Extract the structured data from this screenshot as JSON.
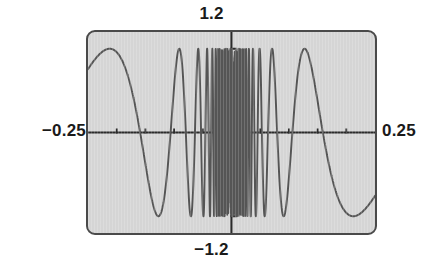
{
  "figure": {
    "kind": "graphing-calculator-screen",
    "labels": {
      "top": "1.2",
      "bottom": "−1.2",
      "left": "−0.25",
      "right": "0.25"
    },
    "colors": {
      "screen_background": "#d5d5d5",
      "frame": "#4a4a4a",
      "curve": "#555555",
      "axis": "#2b2b2b",
      "label_text": "#1a1a1a",
      "page_background": "#ffffff"
    }
  },
  "chart_data": {
    "type": "line",
    "title": "",
    "xlabel": "",
    "ylabel": "",
    "xlim": [
      -0.25,
      0.25
    ],
    "ylim": [
      -1.2,
      1.2
    ],
    "grid": false,
    "legend": null,
    "axes": {
      "x_axis_at_y": 0,
      "y_axis_at_x": 0,
      "x_ticks": [
        -0.2,
        -0.15,
        -0.1,
        -0.05,
        0.05,
        0.1,
        0.15,
        0.2
      ],
      "y_ticks": [
        -1.0,
        -0.8,
        -0.6,
        -0.4,
        -0.2,
        0.2,
        0.4,
        0.6,
        0.8,
        1.0
      ],
      "x_tick_labels": [
        "-0.25",
        "0.25"
      ],
      "y_tick_labels": [
        "-1.2",
        "1.2"
      ]
    },
    "series": [
      {
        "name": "y = sin(1/x)",
        "expression": "sin(1/x)",
        "amplitude": 1.0,
        "x_min": -0.25,
        "x_max": 0.25,
        "sample_count": 4000,
        "notes": "Oscillation frequency increases without bound toward x = 0; plotted curve is clipped to the visible y window [-1.2, 1.2]."
      }
    ]
  }
}
